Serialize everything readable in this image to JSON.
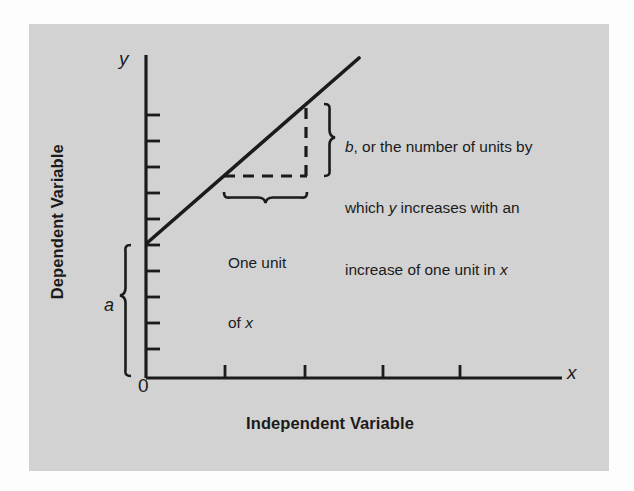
{
  "figure": {
    "panel_background": "#d2d2d2",
    "page_background": "#fdfdfd",
    "stroke_color": "#1b1b1b"
  },
  "axes": {
    "y_axis_title": "Dependent Variable",
    "x_axis_title": "Independent Variable",
    "y_axis_symbol": "y",
    "x_axis_symbol": "x",
    "origin_label": "0"
  },
  "annotations": {
    "intercept_label": "a",
    "slope_text_line1": "b, or the number of units by",
    "slope_text_line2": "which y increases with an",
    "slope_text_line3": "increase of one unit in x",
    "run_text_line1": "One unit",
    "run_text_line2": "of x"
  },
  "chart_data": {
    "type": "line",
    "title": "",
    "xlabel": "Independent Variable",
    "ylabel": "Dependent Variable",
    "xlim": [
      0,
      10
    ],
    "ylim": [
      0,
      10
    ],
    "grid": false,
    "legend": "none",
    "series": [
      {
        "name": "regression-line",
        "x": [
          0.55,
          5.5
        ],
        "y": [
          3.05,
          8.65
        ],
        "style": "solid",
        "equation": "y = a + bx"
      }
    ],
    "x_tick_pixels": [
      225,
      305,
      383,
      460
    ],
    "y_tick_count": 11,
    "annotations": [
      {
        "name": "intercept-brace",
        "label": "a",
        "from_y": 0,
        "to_y": 3.05
      },
      {
        "name": "run-brace",
        "label": "One unit of x",
        "from_x": 2.0,
        "to_x": 3.0
      },
      {
        "name": "rise-brace",
        "label": "b, or the number of units by which y increases with an increase of one unit in x",
        "from_y": 5.5,
        "to_y": 6.6
      },
      {
        "name": "rise-dashed",
        "style": "dashed"
      },
      {
        "name": "run-dashed",
        "style": "dashed"
      }
    ]
  }
}
